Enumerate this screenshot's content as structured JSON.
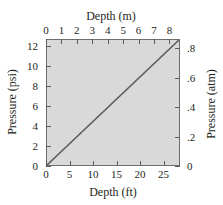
{
  "chart_data": {
    "type": "line",
    "title": "",
    "line_color": "#5c5c5c",
    "plot_background": "#d9d9d9",
    "frame_color": "#6d6d6d",
    "grid": false,
    "legend": null,
    "axes": {
      "bottom": {
        "label": "Depth (ft)",
        "ticks": [
          0,
          5,
          10,
          15,
          20,
          25
        ],
        "ticklabels": [
          "0",
          "5",
          "10",
          "15",
          "20",
          "25"
        ],
        "lim": [
          0,
          28.5
        ]
      },
      "top": {
        "label": "Depth (m)",
        "ticks": [
          0,
          1,
          2,
          3,
          4,
          5,
          6,
          7,
          8
        ],
        "ticklabels": [
          "0",
          "1",
          "2",
          "3",
          "4",
          "5",
          "6",
          "7",
          "8"
        ],
        "lim": [
          0,
          8.686
        ]
      },
      "left": {
        "label": "Pressure (psi)",
        "ticks": [
          0,
          2,
          4,
          6,
          8,
          10,
          12
        ],
        "ticklabels": [
          "0",
          "2",
          "4",
          "6",
          "8",
          "10",
          "12"
        ],
        "lim": [
          0,
          12.7
        ]
      },
      "right": {
        "label": "Pressure (atm)",
        "ticks": [
          0,
          0.2,
          0.4,
          0.6,
          0.8
        ],
        "ticklabels": [
          "0",
          ".2",
          ".4",
          ".6",
          ".8"
        ],
        "lim": [
          0,
          0.864
        ]
      }
    },
    "series": [
      {
        "name": "Pressure vs depth",
        "x_units": "ft",
        "y_units": "psi",
        "x": [
          0,
          28.5
        ],
        "y": [
          0,
          12.7
        ]
      }
    ]
  }
}
